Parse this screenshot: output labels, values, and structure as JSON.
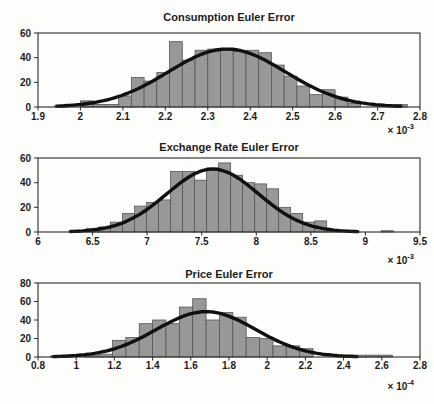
{
  "figure": {
    "background": "#fdfdfc",
    "colors": {
      "bar_fill": "#989898",
      "bar_edge": "#565656",
      "curve": "#101010",
      "axis": "#2a2a2a",
      "text": "#1c1c1c"
    }
  },
  "chart_data": [
    {
      "type": "bar",
      "subtype": "histogram-with-normal-fit",
      "title": "Consumption Euler Error",
      "xlabel": "",
      "ylabel": "",
      "exp_base": "× 10",
      "exp_power": "-3",
      "xlim": [
        1.9,
        2.8
      ],
      "ylim": [
        0,
        60
      ],
      "xtick_labels": [
        "1.9",
        "2",
        "2.1",
        "2.2",
        "2.3",
        "2.4",
        "2.5",
        "2.6",
        "2.7",
        "2.8"
      ],
      "ytick_labels": [
        "0",
        "20",
        "40",
        "60"
      ],
      "bin_width": 0.03,
      "bars": [
        [
          1.955,
          1.5
        ],
        [
          2.015,
          5
        ],
        [
          2.045,
          2
        ],
        [
          2.075,
          2
        ],
        [
          2.105,
          9
        ],
        [
          2.135,
          24
        ],
        [
          2.165,
          21
        ],
        [
          2.195,
          28
        ],
        [
          2.225,
          53
        ],
        [
          2.255,
          38
        ],
        [
          2.285,
          46
        ],
        [
          2.315,
          47
        ],
        [
          2.345,
          46
        ],
        [
          2.375,
          45
        ],
        [
          2.405,
          46
        ],
        [
          2.435,
          44
        ],
        [
          2.465,
          34
        ],
        [
          2.495,
          25
        ],
        [
          2.525,
          17
        ],
        [
          2.555,
          10
        ],
        [
          2.585,
          14
        ],
        [
          2.615,
          8
        ],
        [
          2.645,
          3
        ],
        [
          2.755,
          2
        ]
      ],
      "curve": {
        "mean": 2.345,
        "sigma": 0.138,
        "peak": 47,
        "x_range": [
          1.945,
          2.755
        ]
      },
      "grid": false,
      "legend": null
    },
    {
      "type": "bar",
      "subtype": "histogram-with-normal-fit",
      "title": "Exchange Rate Euler Error",
      "xlabel": "",
      "ylabel": "",
      "exp_base": "× 10",
      "exp_power": "-3",
      "xlim": [
        6,
        9.5
      ],
      "ylim": [
        0,
        60
      ],
      "xtick_labels": [
        "6",
        "6.5",
        "7",
        "7.5",
        "8",
        "8.5",
        "9",
        "9.5"
      ],
      "ytick_labels": [
        "0",
        "20",
        "40",
        "60"
      ],
      "bin_width": 0.11,
      "bars": [
        [
          6.34,
          1
        ],
        [
          6.5,
          3
        ],
        [
          6.61,
          4
        ],
        [
          6.72,
          8
        ],
        [
          6.83,
          15
        ],
        [
          6.94,
          21
        ],
        [
          7.05,
          24
        ],
        [
          7.16,
          26
        ],
        [
          7.27,
          49
        ],
        [
          7.38,
          49
        ],
        [
          7.49,
          42
        ],
        [
          7.6,
          52
        ],
        [
          7.71,
          56
        ],
        [
          7.82,
          46
        ],
        [
          7.93,
          40
        ],
        [
          8.04,
          39
        ],
        [
          8.15,
          35
        ],
        [
          8.26,
          20
        ],
        [
          8.37,
          15
        ],
        [
          8.48,
          8
        ],
        [
          8.59,
          9
        ],
        [
          8.7,
          2
        ],
        [
          9.2,
          1
        ]
      ],
      "curve": {
        "mean": 7.6,
        "sigma": 0.42,
        "peak": 51,
        "x_range": [
          6.3,
          8.93
        ]
      },
      "grid": false,
      "legend": null
    },
    {
      "type": "bar",
      "subtype": "histogram-with-normal-fit",
      "title": "Price Euler Error",
      "xlabel": "",
      "ylabel": "",
      "exp_base": "× 10",
      "exp_power": "-4",
      "xlim": [
        0.8,
        2.8
      ],
      "ylim": [
        0,
        80
      ],
      "xtick_labels": [
        "0.8",
        "1",
        "1.2",
        "1.4",
        "1.6",
        "1.8",
        "2",
        "2.2",
        "2.4",
        "2.6",
        "2.8"
      ],
      "ytick_labels": [
        "0",
        "20",
        "40",
        "60",
        "80"
      ],
      "bin_width": 0.07,
      "bars": [
        [
          0.9,
          1
        ],
        [
          1.08,
          2
        ],
        [
          1.155,
          3
        ],
        [
          1.225,
          18
        ],
        [
          1.295,
          21
        ],
        [
          1.365,
          36
        ],
        [
          1.435,
          40
        ],
        [
          1.505,
          36
        ],
        [
          1.575,
          54
        ],
        [
          1.645,
          63
        ],
        [
          1.715,
          40
        ],
        [
          1.785,
          48
        ],
        [
          1.855,
          43
        ],
        [
          1.925,
          21
        ],
        [
          1.995,
          20
        ],
        [
          2.065,
          12
        ],
        [
          2.135,
          12
        ],
        [
          2.205,
          9
        ],
        [
          2.48,
          2
        ],
        [
          2.55,
          2
        ],
        [
          2.62,
          2
        ]
      ],
      "curve": {
        "mean": 1.68,
        "sigma": 0.26,
        "peak": 49,
        "x_range": [
          0.88,
          2.47
        ]
      },
      "grid": false,
      "legend": null
    }
  ]
}
